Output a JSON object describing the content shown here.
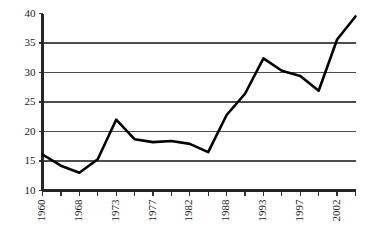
{
  "chart_data": {
    "type": "line",
    "title": "",
    "subtitle": "",
    "xlabel": "",
    "ylabel": "",
    "grid": true,
    "legend": false,
    "legend_position": "none",
    "ylim": [
      10,
      40
    ],
    "y_ticks": [
      10,
      15,
      20,
      25,
      30,
      35,
      40
    ],
    "y_tick_labels": [
      "10",
      "15",
      "20",
      "25",
      "30",
      "35",
      "40"
    ],
    "x_tick_labels": [
      "1960",
      "1968",
      "1973",
      "1977",
      "1982",
      "1988",
      "1993",
      "1997",
      "2002"
    ],
    "x_tick_label_rotation": -90,
    "x_minor_tick_count": 17,
    "categories": [
      "1960",
      "1964",
      "1968",
      "1971",
      "1973",
      "1975",
      "1977",
      "1979",
      "1982",
      "1985",
      "1988",
      "1991",
      "1993",
      "1995",
      "1997",
      "2000",
      "2002",
      "2004"
    ],
    "series": [
      {
        "name": "value",
        "color": "#000000",
        "values": [
          16.1,
          14.2,
          13.0,
          15.3,
          22.0,
          18.7,
          18.2,
          18.4,
          17.9,
          16.5,
          22.8,
          26.4,
          32.4,
          30.3,
          29.4,
          26.9,
          35.6,
          39.5
        ]
      }
    ]
  },
  "axes": {
    "y_axis_name": "y-axis",
    "x_axis_name": "x-axis"
  }
}
